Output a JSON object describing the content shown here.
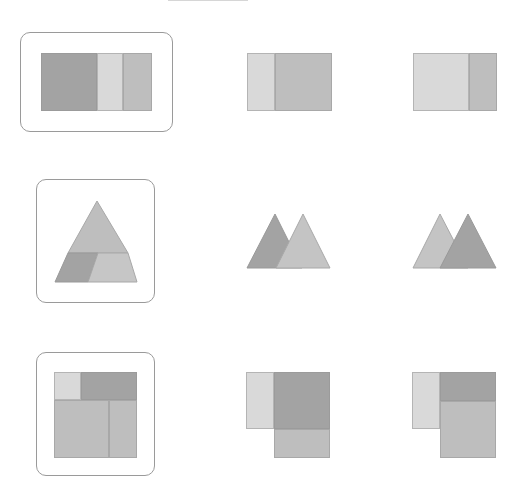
{
  "puzzle": {
    "colors": {
      "dark": "#a3a3a3",
      "mid": "#bebebe",
      "light": "#d9d9d9",
      "frame": "#9a9a9a"
    },
    "rows": [
      {
        "question": {
          "type": "rectangles",
          "parts": [
            "dark",
            "light",
            "mid"
          ]
        },
        "options": [
          {
            "parts": [
              "light",
              "mid"
            ]
          },
          {
            "parts": [
              "light",
              "mid"
            ]
          }
        ]
      },
      {
        "question": {
          "type": "triangle",
          "parts": [
            "mid-top",
            "dark-parallelogram",
            "mid-trapezoid"
          ]
        },
        "options": [
          {
            "parts": [
              "dark-triangle",
              "light-triangle"
            ]
          },
          {
            "parts": [
              "light-triangle",
              "dark-triangle"
            ]
          }
        ]
      },
      {
        "question": {
          "type": "squares",
          "parts": [
            "light",
            "dark",
            "mid",
            "mid"
          ]
        },
        "options": [
          {
            "parts": [
              "light",
              "dark",
              "mid"
            ]
          },
          {
            "parts": [
              "light",
              "dark",
              "mid"
            ]
          }
        ]
      }
    ]
  }
}
